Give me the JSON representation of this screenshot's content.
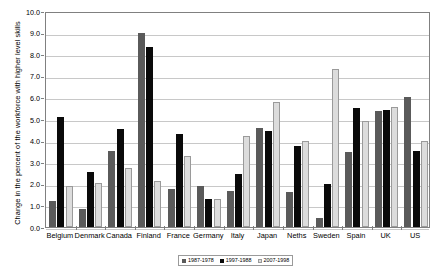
{
  "chart_data": {
    "type": "bar",
    "title": "",
    "xlabel": "",
    "ylabel": "Change in the percent of the workforce with higher level skills",
    "ylim": [
      0.0,
      10.0
    ],
    "ytick_step": 1.0,
    "ytick_labels": [
      "10.0",
      "9.0",
      "8.0",
      "7.0",
      "6.0",
      "5.0",
      "4.0",
      "3.0",
      "2.0",
      "1.0",
      "0.0"
    ],
    "grid": "horizontal",
    "legend_position": "bottom",
    "categories": [
      "Belgium",
      "Denmark",
      "Canada",
      "Finland",
      "France",
      "Germany",
      "Italy",
      "Japan",
      "Neths",
      "Sweden",
      "Spain",
      "UK",
      "US"
    ],
    "series": [
      {
        "name": "1987-1978",
        "color": "#5a5a5a",
        "values": [
          1.2,
          0.85,
          3.5,
          9.0,
          1.75,
          1.9,
          1.65,
          4.6,
          1.6,
          0.4,
          3.45,
          5.35,
          6.0
        ]
      },
      {
        "name": "1997-1988",
        "color": "#0a0a0a",
        "values": [
          5.1,
          2.55,
          4.55,
          8.35,
          4.3,
          1.3,
          2.45,
          4.45,
          3.75,
          2.0,
          5.5,
          5.4,
          3.5
        ]
      },
      {
        "name": "2007-1998",
        "color": "#dcdcdc",
        "values": [
          1.9,
          2.05,
          2.75,
          2.15,
          3.3,
          1.3,
          4.2,
          5.8,
          4.0,
          7.3,
          4.9,
          5.55,
          4.0
        ]
      }
    ]
  },
  "legend": {
    "items": [
      {
        "label": "1987-1978"
      },
      {
        "label": "1997-1988"
      },
      {
        "label": "2007-1998"
      }
    ]
  }
}
